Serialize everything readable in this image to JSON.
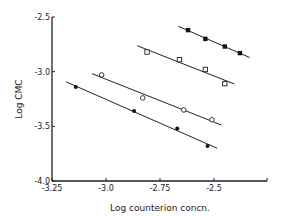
{
  "chart_data": {
    "type": "scatter",
    "title": "",
    "xlabel": "Log counterion concn.",
    "ylabel": "Log CMC",
    "xlim": [
      -3.25,
      -2.25
    ],
    "ylim": [
      -4.0,
      -2.5
    ],
    "x_ticks": [
      "-3.25",
      "-3.0",
      "-2.75",
      "-2.5"
    ],
    "y_ticks": [
      "-2.5",
      "-3.0",
      "-3.5",
      "-4.0"
    ],
    "grid": false,
    "legend": null,
    "series": [
      {
        "name": "filled squares",
        "marker": "filled-square",
        "fit_line": true,
        "x": [
          -2.62,
          -2.54,
          -2.45,
          -2.38
        ],
        "y": [
          -2.62,
          -2.7,
          -2.77,
          -2.83
        ]
      },
      {
        "name": "open squares",
        "marker": "open-square",
        "fit_line": true,
        "x": [
          -2.81,
          -2.66,
          -2.54,
          -2.45
        ],
        "y": [
          -2.82,
          -2.89,
          -2.98,
          -3.11
        ]
      },
      {
        "name": "open circles",
        "marker": "open-circle",
        "fit_line": true,
        "x": [
          -3.02,
          -2.83,
          -2.64,
          -2.51
        ],
        "y": [
          -3.03,
          -3.24,
          -3.35,
          -3.44
        ]
      },
      {
        "name": "filled circles",
        "marker": "filled-circle",
        "fit_line": true,
        "x": [
          -3.14,
          -2.87,
          -2.67,
          -2.53
        ],
        "y": [
          -3.14,
          -3.36,
          -3.52,
          -3.68
        ]
      }
    ]
  }
}
